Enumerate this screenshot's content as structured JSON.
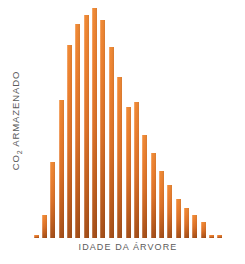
{
  "chart_data": {
    "type": "bar",
    "title": "",
    "subtitle": "",
    "xlabel": "IDADE DA ÁRVORE",
    "ylabel": "CO₂ ARMAZENADO",
    "ylabel_main": "CO",
    "ylabel_sub": "2",
    "ylabel_rest": " ARMAZENADO",
    "grid": false,
    "legend": "none",
    "axis_ticks": false,
    "tick_labels": [],
    "bar_color": "#e07a2a",
    "bar_color_top": "#f08a36",
    "bar_color_bottom": "#a6501a",
    "background_color": "#ffffff",
    "text_color": "#5b5b5b",
    "ylim": [
      0,
      100
    ],
    "categories": [
      "1",
      "2",
      "3",
      "4",
      "5",
      "6",
      "7",
      "8",
      "9",
      "10",
      "11",
      "12",
      "13",
      "14",
      "15",
      "16",
      "17",
      "18",
      "19",
      "20",
      "21",
      "22",
      "23"
    ],
    "values": [
      1.5,
      10,
      33,
      60,
      84,
      93,
      97,
      100,
      95,
      83,
      70,
      57,
      59,
      45,
      37,
      29,
      23,
      17,
      13,
      10,
      7,
      1.5,
      1.5
    ],
    "bar_count": 23
  },
  "labels": {
    "y_axis": "CO₂ ARMAZENADO",
    "x_axis": "IDADE DA ÁRVORE"
  }
}
